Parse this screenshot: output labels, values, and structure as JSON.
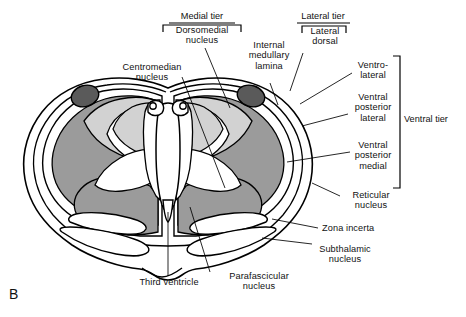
{
  "figure": {
    "panel_letter": "B",
    "caption_subject": "Thalamus coronal section",
    "colors": {
      "outline": "#000000",
      "background": "#ffffff",
      "light_gray": "#d2d2d2",
      "medium_gray": "#9b9b9b",
      "dark_gray": "#5a5a5a",
      "text": "#111111"
    }
  },
  "tiers": {
    "medial": {
      "label": "Medial tier"
    },
    "lateral": {
      "label": "Lateral tier"
    },
    "ventral": {
      "label": "Ventral tier"
    }
  },
  "labels": {
    "dorsomedial_nucleus": "Dorsomedial\nnucleus",
    "centromedian_nucleus": "Centromedian\nnucleus",
    "internal_medullary_lamina": "Internal\nmedullary\nlamina",
    "lateral_dorsal": "Lateral\ndorsal",
    "ventro_lateral": "Ventro-\nlateral",
    "ventral_posterior_lateral": "Ventral\nposterior\nlateral",
    "ventral_posterior_medial": "Ventral\nposterior\nmedial",
    "reticular_nucleus": "Reticular\nnucleus",
    "zona_incerta": "Zona incerta",
    "subthalamic_nucleus": "Subthalamic\nnucleus",
    "third_ventricle": "Third ventricle",
    "parafascicular_nucleus": "Parafascicular\nnucleus"
  }
}
